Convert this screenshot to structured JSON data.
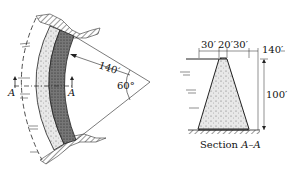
{
  "plan_view": {
    "radius_label": "140′",
    "angle_label": "60°",
    "section_marker_left": "A",
    "section_marker_right": "A"
  },
  "section_view": {
    "top_dims": [
      "30′",
      "20′",
      "30′"
    ],
    "right_dim": "140′",
    "height_dim": "100′",
    "caption_prefix": "Section ",
    "caption_section": "A–A"
  }
}
